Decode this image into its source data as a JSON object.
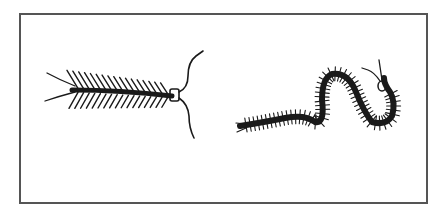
{
  "figure": {
    "frame": {
      "border_color": "#555555"
    },
    "ink_color": "#1a1a1a",
    "subjects": [
      {
        "name": "centipede",
        "position": "left",
        "orientation": "horizontal, head facing right"
      },
      {
        "name": "millipede",
        "position": "right",
        "orientation": "S-curved, head at upper right"
      }
    ]
  }
}
